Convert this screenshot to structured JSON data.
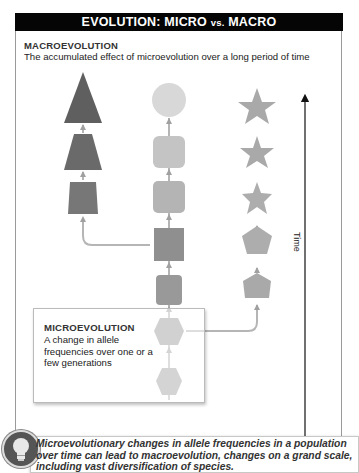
{
  "header": {
    "title_part1": "EVOLUTION: MICRO ",
    "title_vs": "vs.",
    "title_part2": " MACRO"
  },
  "macroevolution": {
    "title": "MACROEVOLUTION",
    "description": "The accumulated effect of microevolution over a long period of time"
  },
  "microevolution": {
    "title": "MICROEVOLUTION",
    "description": "A change in allele frequencies over one or a few generations"
  },
  "time_axis": {
    "label": "Time",
    "direction": "up"
  },
  "lineages": [
    {
      "name": "left-lineage",
      "shapes_bottom_to_top": [
        "trapezoid",
        "trapezoid",
        "triangle"
      ],
      "color": "#6b6b6b"
    },
    {
      "name": "middle-lineage",
      "shapes_bottom_to_top": [
        "hexagon",
        "hexagon",
        "rounded-square",
        "square",
        "rounded-square",
        "rounded-square",
        "circle"
      ],
      "color": "#9a9a9a"
    },
    {
      "name": "right-lineage",
      "shapes_bottom_to_top": [
        "hexagon",
        "pentagon",
        "pentagon",
        "star",
        "star",
        "star"
      ],
      "color": "#a8a8a8"
    }
  ],
  "callout": {
    "icon": "lightbulb-icon",
    "text": "Microevolutionary changes in allele frequencies in a population over time can lead to macroevolution, changes on a grand scale, including vast diversification of species."
  },
  "colors": {
    "header_bg": "#050505",
    "header_text": "#ffffff",
    "left_lineage": "#6b6b6b",
    "middle_lineage_dark": "#8f8f8f",
    "middle_lineage_light": "#d4d4d4",
    "right_lineage": "#a8a8a8",
    "connector": "#b5b5b5"
  }
}
